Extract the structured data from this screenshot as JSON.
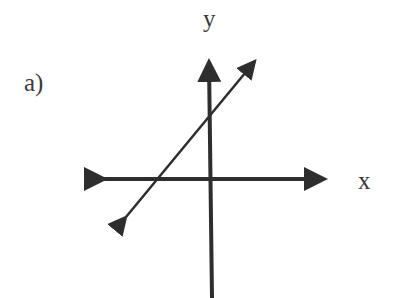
{
  "figure": {
    "part_label": "a)",
    "axes": {
      "x_label": "x",
      "y_label": "y"
    },
    "line": {
      "description": "straight line with positive slope, y-intercept positive, x-intercept negative",
      "slope_sign": "positive"
    },
    "colors": {
      "stroke": "#2e2e2e",
      "text": "#3a3a3a",
      "background": "#ffffff"
    }
  }
}
